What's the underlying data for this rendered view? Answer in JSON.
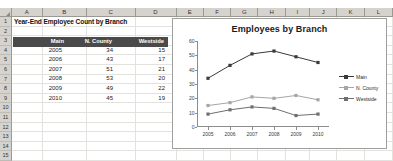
{
  "spreadsheet": {
    "column_headers": [
      "A",
      "B",
      "C",
      "D",
      "E",
      "F",
      "G",
      "H",
      "I",
      "J",
      "K",
      "L"
    ],
    "row_headers": [
      "1",
      "2",
      "3",
      "4",
      "5",
      "6",
      "7",
      "8",
      "9",
      "10",
      "11",
      "12",
      "13",
      "14",
      "15"
    ],
    "title": "Year-End Employee Count by Branch",
    "table_headers": [
      "",
      "Main",
      "N. County",
      "Westside"
    ],
    "rows": [
      {
        "year": "2005",
        "main": "34",
        "ncounty": "15",
        "westside": "9"
      },
      {
        "year": "2006",
        "main": "43",
        "ncounty": "17",
        "westside": "12"
      },
      {
        "year": "2007",
        "main": "51",
        "ncounty": "21",
        "westside": "14"
      },
      {
        "year": "2008",
        "main": "53",
        "ncounty": "20",
        "westside": "13"
      },
      {
        "year": "2009",
        "main": "49",
        "ncounty": "22",
        "westside": "8"
      },
      {
        "year": "2010",
        "main": "45",
        "ncounty": "19",
        "westside": "9"
      }
    ]
  },
  "chart_data": {
    "type": "line",
    "title": "Employees by Branch",
    "xlabel": "",
    "ylabel": "",
    "categories": [
      "2005",
      "2006",
      "2007",
      "2008",
      "2009",
      "2010"
    ],
    "series": [
      {
        "name": "Main",
        "values": [
          34,
          43,
          51,
          53,
          49,
          45
        ],
        "color": "#3a3a3a"
      },
      {
        "name": "N. County",
        "values": [
          15,
          17,
          21,
          20,
          22,
          19
        ],
        "color": "#a6a6a6"
      },
      {
        "name": "Westside",
        "values": [
          9,
          12,
          14,
          13,
          8,
          9
        ],
        "color": "#6f6f6f"
      }
    ],
    "ylim": [
      0,
      60
    ],
    "yticks": [
      "0",
      "10",
      "20",
      "30",
      "40",
      "50",
      "60"
    ],
    "grid": false,
    "legend_position": "right"
  }
}
